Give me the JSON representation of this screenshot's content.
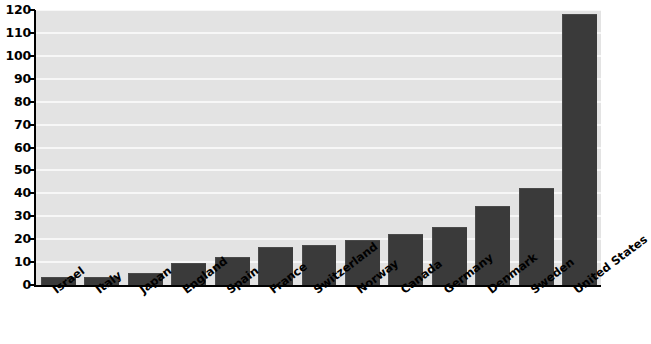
{
  "chart_data": {
    "type": "bar",
    "title": "",
    "subtitle": "",
    "xlabel": "",
    "ylabel": "",
    "ylim": [
      0,
      120
    ],
    "ytick_step": 10,
    "yticks": [
      0,
      10,
      20,
      30,
      40,
      50,
      60,
      70,
      80,
      90,
      100,
      110,
      120
    ],
    "ytick_labels": [
      "0",
      "10",
      "20",
      "30",
      "40",
      "50",
      "60",
      "70",
      "80",
      "90",
      "100",
      "110",
      "120"
    ],
    "grid": true,
    "grid_axis": "y",
    "legend": false,
    "legend_position": "none",
    "categories": [
      "Israel",
      "Italy",
      "Japan",
      "England",
      "Spain",
      "France",
      "Switzerland",
      "Norway",
      "Canada",
      "Germany",
      "Denmark",
      "Sweden",
      "United States"
    ],
    "values": [
      3,
      3,
      5,
      9,
      12,
      16,
      17,
      19,
      22,
      25,
      34,
      42,
      118
    ],
    "series": [
      {
        "name": "",
        "values": [
          3,
          3,
          5,
          9,
          12,
          16,
          17,
          19,
          22,
          25,
          34,
          42,
          118
        ]
      }
    ],
    "annotations": []
  },
  "style": {
    "bar_color": "#3a3a3a",
    "plot_background": "#e3e3e3",
    "gridline_color": "#f7f7f7",
    "axis_color": "#000000",
    "page_background": "#ffffff",
    "text_color": "#000000"
  },
  "caption": {
    "text": ""
  }
}
